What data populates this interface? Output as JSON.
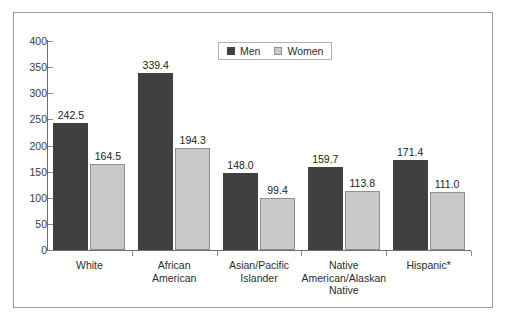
{
  "chart_data": {
    "type": "bar",
    "title": "",
    "subtitle": "",
    "xlabel": "",
    "ylabel": "",
    "ylim": [
      0,
      400
    ],
    "ytick_labels": [
      "0",
      "50",
      "100",
      "150",
      "200",
      "250",
      "300",
      "350",
      "400"
    ],
    "ytick_values": [
      0,
      50,
      100,
      150,
      200,
      250,
      300,
      350,
      400
    ],
    "grid": false,
    "legend_position": "top-right-inside",
    "categories": [
      "White",
      "African\nAmerican",
      "Asian/Pacific\nIslander",
      "Native\nAmerican/Alaskan\nNative",
      "Hispanic*"
    ],
    "series": [
      {
        "name": "Men",
        "color": "#404040",
        "values": [
          242.5,
          339.4,
          148.0,
          159.7,
          171.4
        ],
        "value_labels": [
          "242.5",
          "339.4",
          "148.0",
          "159.7",
          "171.4"
        ]
      },
      {
        "name": "Women",
        "color": "#c9c9c9",
        "values": [
          164.5,
          194.3,
          99.4,
          113.8,
          111.0
        ],
        "value_labels": [
          "164.5",
          "194.3",
          "99.4",
          "113.8",
          "111.0"
        ]
      }
    ]
  },
  "legend": {
    "items": [
      {
        "label": "Men",
        "swatch": "men"
      },
      {
        "label": "Women",
        "swatch": "women"
      }
    ]
  },
  "colors": {
    "men_bar": "#404040",
    "women_bar": "#c9c9c9",
    "women_bar_edge": "#8f8f8f",
    "axis": "#6e6e6e",
    "frame": "#9a9a9a",
    "text": "#2d2d2d",
    "background": "#ffffff"
  }
}
